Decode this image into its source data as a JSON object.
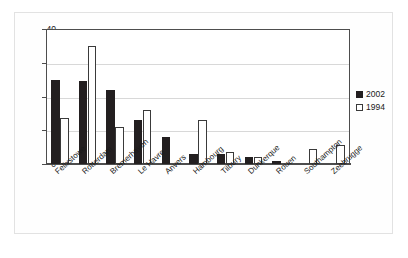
{
  "chart_data": {
    "type": "bar",
    "title": "",
    "subtitle": "",
    "xlabel": "",
    "ylabel": "",
    "ylim": [
      0,
      40
    ],
    "yticks": [
      0,
      10,
      20,
      30,
      40
    ],
    "grid": true,
    "legend_position": "right",
    "categories": [
      "Felixstowe",
      "Rotterdam",
      "Bremerhaven",
      "Le Havre",
      "Anvers",
      "Hambourg",
      "Tilbury",
      "Dunkerque",
      "Rouen",
      "Southampton",
      "Zeebrugge"
    ],
    "series": [
      {
        "name": "2002",
        "color": "#231f20",
        "values": [
          25,
          24.5,
          22,
          13,
          8,
          3,
          3,
          2,
          1,
          0,
          0
        ]
      },
      {
        "name": "1994",
        "color": "#ffffff",
        "values": [
          13.5,
          35,
          11,
          16,
          0,
          13,
          3.5,
          2,
          0,
          4.5,
          5.5
        ]
      }
    ]
  },
  "legend": {
    "items": [
      {
        "label": "2002",
        "swatch": "filled-black-square-icon"
      },
      {
        "label": "1994",
        "swatch": "hollow-white-square-icon"
      }
    ]
  }
}
